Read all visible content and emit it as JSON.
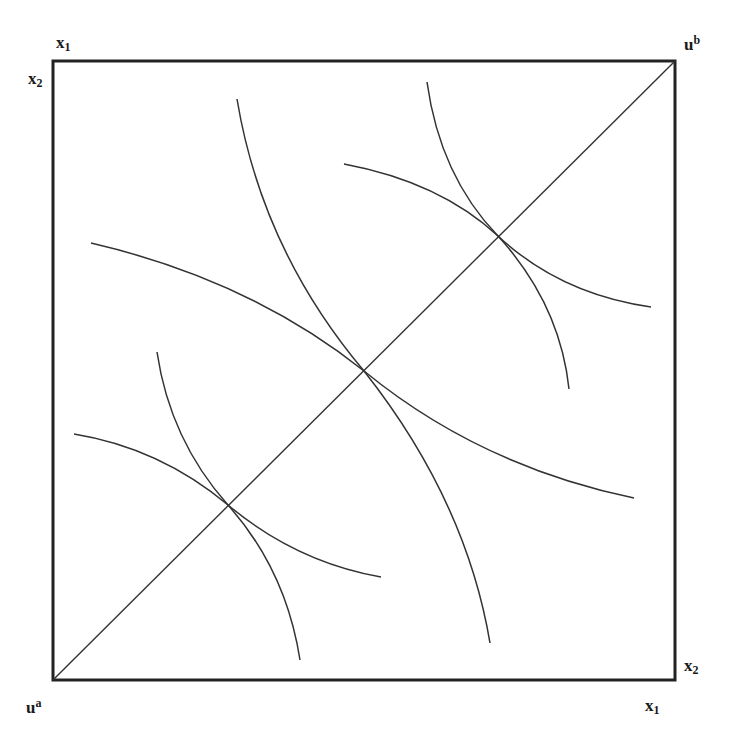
{
  "diagram": {
    "type": "edgeworth-box",
    "box": {
      "x": 53,
      "y": 61,
      "width": 622,
      "height": 619,
      "stroke": "#222222",
      "stroke_width": 3
    },
    "contract_curve": {
      "from": [
        53,
        680
      ],
      "to": [
        675,
        61
      ],
      "stroke": "#333333"
    },
    "tangency_points": [
      [
        228,
        505
      ],
      [
        364,
        371
      ],
      [
        498,
        236
      ]
    ],
    "curves": [
      {
        "id": "a-low",
        "d": "M74,434 Q160,448 228,505 T381,577"
      },
      {
        "id": "b-low",
        "d": "M157,352 Q170,440 228,505 T300,660"
      },
      {
        "id": "a-mid",
        "d": "M91,243 Q250,280 364,371 Q480,466 634,498"
      },
      {
        "id": "b-mid",
        "d": "M237,99 Q262,250 364,371 Q466,500 490,643"
      },
      {
        "id": "a-high",
        "d": "M344,164 Q440,182 498,236 Q560,294 651,307"
      },
      {
        "id": "b-high",
        "d": "M427,82 Q440,176 498,236 Q560,304 569,389"
      }
    ],
    "curve_stroke": "#333333"
  },
  "labels": {
    "top_left_x1": {
      "base": "x",
      "sub": "1"
    },
    "top_left_x2": {
      "base": "x",
      "sub": "2"
    },
    "origin_b": {
      "base": "u",
      "sup": "b"
    },
    "origin_a": {
      "base": "u",
      "sup": "a"
    },
    "bottom_right_x2": {
      "base": "x",
      "sub": "2"
    },
    "bottom_right_x1": {
      "base": "x",
      "sub": "1"
    }
  }
}
